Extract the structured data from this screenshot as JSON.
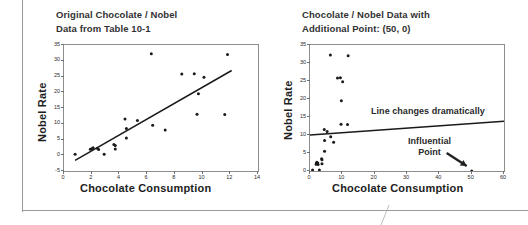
{
  "page": {
    "background": "#ffffff",
    "frame_color": "#9a9a9a"
  },
  "charts": [
    {
      "id": "left",
      "title_line1": "Original Chocolate / Nobel",
      "title_line2": "Data from Table 10-1",
      "xlabel": "Chocolate Consumption",
      "ylabel": "Nobel Rate",
      "xticks": [
        "0",
        "2",
        "4",
        "6",
        "8",
        "10",
        "12",
        "14"
      ],
      "yticks": [
        "-5",
        "0",
        "5",
        "10",
        "15",
        "20",
        "25",
        "30",
        "35"
      ]
    },
    {
      "id": "right",
      "title_line1": "Chocolate / Nobel Data with",
      "title_line2": "Additional Point: (50, 0)",
      "xlabel": "Chocolate Consumption",
      "ylabel": "Nobel Rate",
      "xticks": [
        "0",
        "10",
        "20",
        "30",
        "40",
        "50",
        "60"
      ],
      "yticks": [
        "0",
        "5",
        "10",
        "15",
        "20",
        "25",
        "30",
        "35"
      ],
      "annotations": {
        "line_changes": "Line changes dramatically",
        "influential_l1": "Influential",
        "influential_l2": "Point"
      }
    }
  ],
  "chart_data": [
    {
      "type": "scatter",
      "title": "Original Chocolate / Nobel Data from Table 10-1",
      "xlabel": "Chocolate Consumption",
      "ylabel": "Nobel Rate",
      "xlim": [
        0,
        14
      ],
      "ylim": [
        -5,
        35
      ],
      "xticks": [
        0,
        2,
        4,
        6,
        8,
        10,
        12,
        14
      ],
      "yticks": [
        -5,
        0,
        5,
        10,
        15,
        20,
        25,
        30,
        35
      ],
      "grid": false,
      "legend": "none",
      "marker_color": "#1a1a1a",
      "line_color": "#1a1a1a",
      "points": [
        [
          0.8,
          0.3
        ],
        [
          1.9,
          1.9
        ],
        [
          2.0,
          2.1
        ],
        [
          2.1,
          2.4
        ],
        [
          2.4,
          2.2
        ],
        [
          2.5,
          1.8
        ],
        [
          2.9,
          0.3
        ],
        [
          3.6,
          3.4
        ],
        [
          3.7,
          2.0
        ],
        [
          3.7,
          3.1
        ],
        [
          4.4,
          11.5
        ],
        [
          4.5,
          8.5
        ],
        [
          4.5,
          5.5
        ],
        [
          5.3,
          11.0
        ],
        [
          6.3,
          32.2
        ],
        [
          6.4,
          9.5
        ],
        [
          7.3,
          8.0
        ],
        [
          8.5,
          25.8
        ],
        [
          9.4,
          25.9
        ],
        [
          9.7,
          19.5
        ],
        [
          10.1,
          24.8
        ],
        [
          11.6,
          12.9
        ],
        [
          11.8,
          32.0
        ],
        [
          9.6,
          13.0
        ]
      ],
      "trendline": {
        "label": "regression line",
        "x": [
          0.8,
          12.1
        ],
        "y": [
          -1.6,
          26.9
        ]
      }
    },
    {
      "type": "scatter",
      "title": "Chocolate / Nobel Data with Additional Point: (50, 0)",
      "xlabel": "Chocolate Consumption",
      "ylabel": "Nobel Rate",
      "xlim": [
        0,
        60
      ],
      "ylim": [
        0,
        35
      ],
      "xticks": [
        0,
        10,
        20,
        30,
        40,
        50,
        60
      ],
      "yticks": [
        0,
        5,
        10,
        15,
        20,
        25,
        30,
        35
      ],
      "grid": false,
      "legend": "none",
      "marker_color": "#1a1a1a",
      "line_color": "#1a1a1a",
      "points": [
        [
          0.8,
          0.3
        ],
        [
          1.9,
          1.9
        ],
        [
          2.0,
          2.1
        ],
        [
          2.1,
          2.4
        ],
        [
          2.4,
          2.2
        ],
        [
          2.5,
          1.8
        ],
        [
          2.9,
          0.3
        ],
        [
          3.6,
          3.4
        ],
        [
          3.7,
          2.0
        ],
        [
          3.7,
          3.1
        ],
        [
          4.4,
          11.5
        ],
        [
          4.5,
          8.5
        ],
        [
          4.5,
          5.5
        ],
        [
          5.3,
          11.0
        ],
        [
          6.3,
          32.2
        ],
        [
          6.4,
          9.5
        ],
        [
          7.3,
          8.0
        ],
        [
          8.5,
          25.8
        ],
        [
          9.4,
          25.9
        ],
        [
          9.7,
          19.5
        ],
        [
          10.1,
          24.8
        ],
        [
          11.6,
          12.9
        ],
        [
          11.8,
          32.0
        ],
        [
          9.6,
          13.0
        ],
        [
          50.0,
          0.0
        ]
      ],
      "influential_point": [
        50.0,
        0.0
      ],
      "trendline": {
        "label": "regression line with influential point",
        "x": [
          0.0,
          60.0
        ],
        "y": [
          10.0,
          13.8
        ]
      },
      "annotations": [
        {
          "text": "Line changes dramatically",
          "x": 16,
          "y": 16
        },
        {
          "text": "Influential Point",
          "x": 33,
          "y": 6
        }
      ]
    }
  ]
}
